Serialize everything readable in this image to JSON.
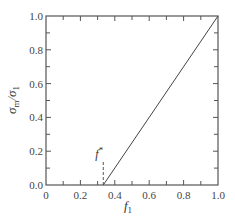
{
  "chart_data": {
    "type": "line",
    "title": "",
    "xlabel": "f",
    "xlabel_sub": "1",
    "ylabel_num": "σ",
    "ylabel_num_sub": "m",
    "ylabel_den": "σ",
    "ylabel_den_sub": "1",
    "xlim": [
      0,
      1.0
    ],
    "ylim": [
      0,
      1.0
    ],
    "x_major_ticks": [
      0,
      0.2,
      0.4,
      0.6,
      0.8,
      1.0
    ],
    "x_tick_labels": [
      "0",
      "0.2",
      "0.4",
      "0.6",
      "0.8",
      "1.0"
    ],
    "y_major_ticks": [
      0,
      0.2,
      0.4,
      0.6,
      0.8,
      1.0
    ],
    "y_tick_labels": [
      "0.0",
      "0.2",
      "0.4",
      "0.6",
      "0.8",
      "1.0"
    ],
    "minor_tick_step": 0.1,
    "grid": false,
    "series": [
      {
        "name": "sigma_m/sigma_1",
        "x": [
          0.333,
          1.0
        ],
        "y": [
          0.0,
          1.0
        ]
      }
    ],
    "annotations": [
      {
        "text": "f",
        "superscript": "*",
        "x": 0.333,
        "marker": "dashed-vertical",
        "y_top": 0.14
      }
    ]
  }
}
